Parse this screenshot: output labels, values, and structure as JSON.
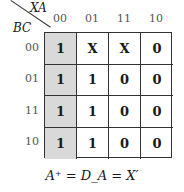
{
  "kmap": {
    "col_var": "XA",
    "row_var": "BC",
    "col_headers": [
      "00",
      "01",
      "11",
      "10"
    ],
    "row_headers": [
      "00",
      "01",
      "11",
      "10"
    ],
    "cells": [
      [
        "1",
        "X",
        "X",
        "0"
      ],
      [
        "1",
        "1",
        "0",
        "0"
      ],
      [
        "1",
        "1",
        "0",
        "0"
      ],
      [
        "1",
        "1",
        "0",
        "0"
      ]
    ],
    "shaded_column": 0,
    "shade_color": "#d9d9d9"
  },
  "equation": "A⁺ = D_A = X′"
}
